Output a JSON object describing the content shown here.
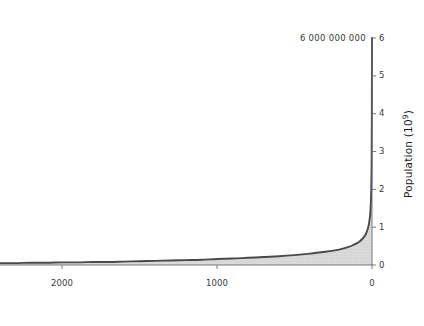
{
  "chart_data": {
    "type": "area",
    "title": "",
    "subtitle": "",
    "xlabel": "",
    "ylabel": "Population (10⁹)",
    "ylabel_base": "Population (10",
    "ylabel_exp": "9",
    "ylabel_close": ")",
    "xlim": [
      2400,
      0
    ],
    "ylim": [
      0,
      6
    ],
    "x_axis_position": "bottom",
    "y_axis_position": "right",
    "x_axis_direction": "reversed",
    "grid": false,
    "legend": null,
    "fill_color": "#d9d9d9",
    "line_color": "#4a4a4a",
    "axis_color": "#6b6b6b",
    "background_color": "#ffffff",
    "text_color": "#3a3a3a",
    "xticks": [
      2000,
      1000,
      0
    ],
    "xtick_labels": [
      "2000",
      "1000",
      "0"
    ],
    "yticks": [
      0,
      1,
      2,
      3,
      4,
      5,
      6
    ],
    "ytick_labels": [
      "0",
      "1",
      "2",
      "3",
      "4",
      "5",
      "6"
    ],
    "annotations": [
      {
        "name": "peak-value-annotation",
        "text": "6 000 000 000",
        "x": 0,
        "y": 6
      }
    ],
    "x": [
      2400,
      2300,
      2200,
      2100,
      2000,
      1900,
      1800,
      1700,
      1600,
      1500,
      1400,
      1300,
      1200,
      1100,
      1000,
      900,
      800,
      700,
      600,
      500,
      400,
      300,
      250,
      200,
      150,
      120,
      100,
      80,
      60,
      50,
      40,
      30,
      25,
      20,
      15,
      12,
      10,
      8,
      6,
      5,
      4,
      3,
      2,
      1,
      0
    ],
    "values": [
      0.05,
      0.05,
      0.06,
      0.06,
      0.07,
      0.07,
      0.08,
      0.08,
      0.09,
      0.1,
      0.11,
      0.12,
      0.13,
      0.14,
      0.16,
      0.17,
      0.19,
      0.21,
      0.23,
      0.26,
      0.3,
      0.35,
      0.38,
      0.42,
      0.48,
      0.53,
      0.57,
      0.62,
      0.7,
      0.75,
      0.82,
      0.92,
      0.99,
      1.08,
      1.22,
      1.33,
      1.45,
      1.6,
      1.82,
      1.98,
      2.2,
      2.55,
      3.1,
      4.1,
      6.0
    ]
  },
  "axis_geometry": {
    "plot_left_px": 0,
    "plot_right_px": 372,
    "plot_top_px": 38,
    "plot_bottom_px": 265
  }
}
